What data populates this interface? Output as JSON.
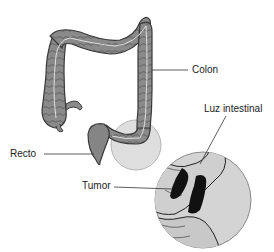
{
  "diagram": {
    "labels": {
      "colon": "Colon",
      "luz_intestinal": "Luz intestinal",
      "recto": "Recto",
      "tumor": "Tumor"
    },
    "colors": {
      "colon_fill": "#8a8a8a",
      "colon_outline": "#3a3a3a",
      "lumen_line": "#e8e8e8",
      "magnifier_fill": "#d4d4d4",
      "highlight_fill": "#dedede",
      "tumor_fill": "#111111",
      "leader_line": "#333333",
      "background": "#ffffff"
    }
  }
}
